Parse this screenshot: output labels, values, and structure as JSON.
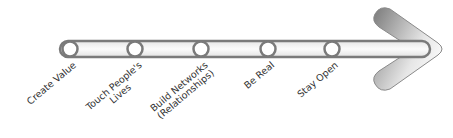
{
  "diagram": {
    "type": "timeline-arrow",
    "colors": {
      "bar_outline": "#7a7a7a",
      "bar_fill": "#f2f2f2",
      "circle_fill": "#ffffff",
      "arrowhead_dark": "#7d7d7d",
      "arrowhead_light": "#f4f4f4",
      "text": "#333333"
    },
    "milestones": [
      {
        "lines": [
          "Create Value"
        ],
        "cx": 70
      },
      {
        "lines": [
          "Touch People's",
          "Lives"
        ],
        "cx": 135
      },
      {
        "lines": [
          "Build Networks",
          "(Relationships)"
        ],
        "cx": 201
      },
      {
        "lines": [
          "Be Real"
        ],
        "cx": 268
      },
      {
        "lines": [
          "Stay Open"
        ],
        "cx": 332
      }
    ]
  }
}
